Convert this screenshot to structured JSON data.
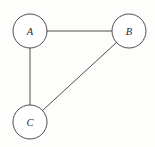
{
  "figure": {
    "title": "",
    "background_color": "#fdfdfc",
    "stroke_color": "#3a3a3a",
    "label_color": "#2b2b2b",
    "node_fill": "#ffffff"
  },
  "chart_data": {
    "type": "diagram",
    "diagram_kind": "undirected-graph",
    "title": "",
    "xlabel": "",
    "ylabel": "",
    "grid": false,
    "legend": null,
    "nodes": [
      {
        "id": "A",
        "label": "A",
        "cx": 30,
        "cy": 31,
        "r": 17
      },
      {
        "id": "B",
        "label": "B",
        "cx": 129,
        "cy": 31,
        "r": 17
      },
      {
        "id": "C",
        "label": "C",
        "cx": 30,
        "cy": 122,
        "r": 17
      }
    ],
    "edges": [
      {
        "from": "A",
        "to": "B",
        "x1": 47,
        "y1": 31,
        "x2": 112,
        "y2": 31,
        "directed": false
      },
      {
        "from": "A",
        "to": "C",
        "x1": 30,
        "y1": 48,
        "x2": 30,
        "y2": 105,
        "directed": false
      },
      {
        "from": "B",
        "to": "C",
        "x1": 117.4,
        "y1": 43.8,
        "x2": 42.6,
        "y2": 109.2,
        "directed": false
      }
    ]
  }
}
